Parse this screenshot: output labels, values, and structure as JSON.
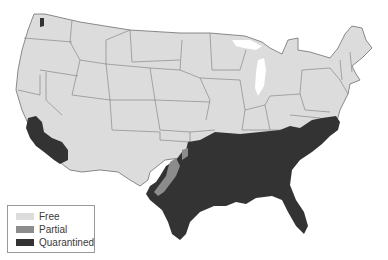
{
  "map": {
    "subject": "Contiguous United States quarantine status",
    "colors": {
      "free": "#dcdcdc",
      "partial": "#8c8c8c",
      "quarantined": "#333333",
      "border": "#6e6e6e",
      "background": "#ffffff"
    }
  },
  "legend": {
    "items": [
      {
        "label": "Free",
        "color": "#dcdcdc"
      },
      {
        "label": "Partial",
        "color": "#8c8c8c"
      },
      {
        "label": "Quarantined",
        "color": "#333333"
      }
    ]
  }
}
